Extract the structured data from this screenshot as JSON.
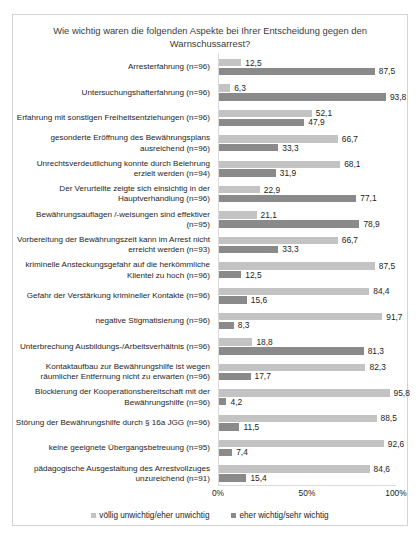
{
  "chart_data": {
    "type": "bar",
    "orientation": "horizontal",
    "title": "Wie wichtig waren die folgenden Aspekte bei Ihrer Entscheidung gegen den Warnschussarrest?",
    "xlabel": "",
    "ylabel": "",
    "xlim": [
      0,
      100
    ],
    "xticks": [
      "0%",
      "50%",
      "100%"
    ],
    "xtick_values": [
      0,
      50,
      100
    ],
    "grid": false,
    "legend_position": "bottom",
    "colors": {
      "series_1": "#c3c3c3",
      "series_2": "#8a8a8a",
      "frame": "#d4d4d4",
      "axis": "#d9d9d9"
    },
    "series": [
      {
        "name": "völlig unwichtig/eher unwichtig",
        "color": "#c3c3c3",
        "values": [
          12.5,
          6.3,
          52.1,
          66.7,
          68.1,
          22.9,
          21.1,
          66.7,
          87.5,
          84.4,
          91.7,
          18.8,
          82.3,
          95.8,
          88.5,
          92.6,
          84.6
        ],
        "labels": [
          "12,5",
          "6,3",
          "52,1",
          "66,7",
          "68,1",
          "22,9",
          "21,1",
          "66,7",
          "87,5",
          "84,4",
          "91,7",
          "18,8",
          "82,3",
          "95,8",
          "88,5",
          "92,6",
          "84,6"
        ]
      },
      {
        "name": "eher wichtig/sehr wichtig",
        "color": "#8a8a8a",
        "values": [
          87.5,
          93.8,
          47.9,
          33.3,
          31.9,
          77.1,
          78.9,
          33.3,
          12.5,
          15.6,
          8.3,
          81.3,
          17.7,
          4.2,
          11.5,
          7.4,
          15.4
        ],
        "labels": [
          "87,5",
          "93,8",
          "47,9",
          "33,3",
          "31,9",
          "77,1",
          "78,9",
          "33,3",
          "12,5",
          "15,6",
          "8,3",
          "81,3",
          "17,7",
          "4,2",
          "11,5",
          "7,4",
          "15,4"
        ]
      }
    ],
    "categories": [
      "Arresterfahrung (n=96)",
      "Untersuchungshafterfahrung (n=96)",
      "Erfahrung mit sonstigen Freiheitsentziehungen (n=96)",
      "gesonderte Eröffnung des Bewährungsplans ausreichend (n=96)",
      "Unrechtsverdeutlichung konnte durch Belehrung erzielt werden (n=94)",
      "Der Verurteilte zeigte sich einsichtig in der Hauptverhandlung (n=96)",
      "Bewährungsauflagen /-weisungen sind effektiver (n=95)",
      "Vorbereitung der Bewährungszeit kann im Arrest nicht erreicht werden (n=93)",
      "kriminelle Ansteckungsgefahr auf die herkömmliche Klientel zu hoch (n=96)",
      "Gefahr der Verstärkung krimineller Kontakte (n=96)",
      "negative Stigmatisierung (n=96)",
      "Unterbrechung Ausbildungs-/Arbeitsverhältnis (n=96)",
      "Kontaktaufbau zur Bewährungshilfe ist wegen räumlicher Entfernung nicht zu erwarten (n=96)",
      "Blockierung der Kooperationsbereitschaft mit der Bewährungshilfe (n=96)",
      "Störung der Bewährungshilfe durch § 16a JGG (n=96)",
      "keine geeignete Übergangsbetreuung  (n=95)",
      "pädagogische Ausgestaltung des Arrestvollzuges unzureichend (n=91)"
    ]
  },
  "legend": {
    "items": [
      {
        "label": "völlig unwichtig/eher unwichtig"
      },
      {
        "label": "eher wichtig/sehr wichtig"
      }
    ]
  }
}
